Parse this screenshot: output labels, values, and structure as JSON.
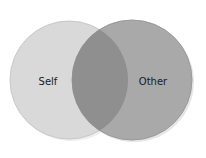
{
  "diagram": {
    "type": "venn",
    "sets": [
      {
        "label": "Self",
        "color": "#d9d9d9"
      },
      {
        "label": "Other",
        "color": "#a9a9a9"
      }
    ],
    "intersection_color": "#8f8f8f",
    "outline_color": "#bdbdbd"
  }
}
